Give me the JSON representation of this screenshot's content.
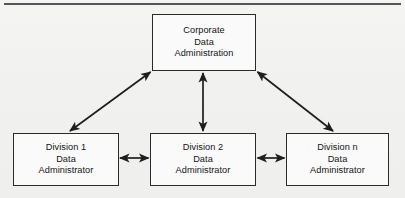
{
  "figure": {
    "type": "organizational-hierarchy-diagram",
    "background_color": "#f2f2f0",
    "line_color": "#2b2b2b",
    "top_rule_color": "#55565a"
  },
  "nodes": {
    "corporate": {
      "id": "corporate-data-administration",
      "line1": "Corporate",
      "line2": "Data",
      "line3": "Administration"
    },
    "division1": {
      "id": "division-1-data-administrator",
      "line1": "Division 1",
      "line2": "Data",
      "line3": "Administrator"
    },
    "division2": {
      "id": "division-2-data-administrator",
      "line1": "Division 2",
      "line2": "Data",
      "line3": "Administrator"
    },
    "divisionN": {
      "id": "division-n-data-administrator",
      "line1": "Division n",
      "line2": "Data",
      "line3": "Administrator"
    }
  },
  "connectors": [
    {
      "name": "corporate-to-division1",
      "from": "corporate",
      "to": "division1",
      "style": "double-headed-arrow",
      "orientation": "diagonal"
    },
    {
      "name": "corporate-to-division2",
      "from": "corporate",
      "to": "division2",
      "style": "double-headed-arrow",
      "orientation": "vertical"
    },
    {
      "name": "corporate-to-divisionN",
      "from": "corporate",
      "to": "divisionN",
      "style": "double-headed-arrow",
      "orientation": "diagonal"
    },
    {
      "name": "division1-to-division2",
      "from": "division1",
      "to": "division2",
      "style": "double-headed-arrow",
      "orientation": "horizontal"
    },
    {
      "name": "division2-to-divisionN",
      "from": "division2",
      "to": "divisionN",
      "style": "double-headed-arrow",
      "orientation": "horizontal"
    }
  ]
}
